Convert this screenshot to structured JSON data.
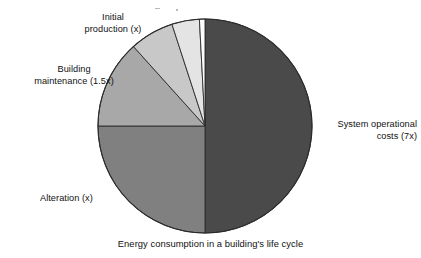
{
  "figure": {
    "caption": "Energy consumption in a building's life cycle",
    "background_color": "#ffffff",
    "text_color": "#111111"
  },
  "chart_data": {
    "type": "pie",
    "title": "Energy consumption in a building's life cycle",
    "xlabel": "",
    "ylabel": "",
    "legend_position": "callout-labels",
    "grid": false,
    "center": {
      "x": 205,
      "y": 126
    },
    "radius": 107,
    "start_angle_deg": 0,
    "direction": "clockwise",
    "categories": [
      "System operational costs (7x)",
      "Alteration (x)",
      "Building maintenance (1.5x)",
      "Initial production (x)",
      "Unlabeled pale slice",
      "Unlabeled white sliver"
    ],
    "values": [
      50.0,
      25.0,
      13.3,
      6.7,
      4.2,
      0.8
    ],
    "value_unit": "percent",
    "relative_multipliers": [
      7,
      1,
      1.5,
      1,
      null,
      null
    ],
    "colors": [
      "#4a4a4a",
      "#808080",
      "#a8a8a8",
      "#c8c8c8",
      "#e4e4e4",
      "#fdfdfd"
    ],
    "slices": [
      {
        "label": "System operational costs (7x)",
        "value": 50.0,
        "multiplier": "7x",
        "color": "#4a4a4a",
        "start_angle_deg": 0,
        "end_angle_deg": 180
      },
      {
        "label": "Alteration (x)",
        "value": 25.0,
        "multiplier": "x",
        "color": "#808080",
        "start_angle_deg": 180,
        "end_angle_deg": 270
      },
      {
        "label": "Building maintenance (1.5x)",
        "value": 13.3,
        "multiplier": "1.5x",
        "color": "#a8a8a8",
        "start_angle_deg": 270,
        "end_angle_deg": 318
      },
      {
        "label": "Initial production (x)",
        "value": 6.7,
        "multiplier": "x",
        "color": "#c8c8c8",
        "start_angle_deg": 318,
        "end_angle_deg": 342
      },
      {
        "label": "Unlabeled pale slice",
        "value": 4.2,
        "multiplier": null,
        "color": "#e4e4e4",
        "start_angle_deg": 342,
        "end_angle_deg": 357
      },
      {
        "label": "Unlabeled white sliver",
        "value": 0.8,
        "multiplier": null,
        "color": "#fdfdfd",
        "start_angle_deg": 357,
        "end_angle_deg": 360
      }
    ]
  },
  "labels": {
    "initial_production": "Initial\nproduction (x)",
    "building_maintenance": "Building\nmaintenance (1.5x)",
    "alteration": "Alteration (x)",
    "system_operational": "System operational\ncosts (7x)"
  }
}
